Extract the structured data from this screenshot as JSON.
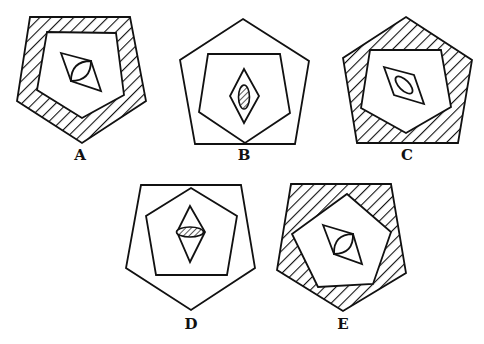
{
  "figures": [
    {
      "id": "A",
      "label": "A",
      "label_pos": [
        80,
        160
      ],
      "outer": {
        "points": "30,17 130,17 146,101 82,143 17,101",
        "fill": "hatched"
      },
      "inner": {
        "points": "47,32 116,33 124,95 82,118 37,90",
        "fill": "white"
      },
      "diamond": {
        "points": "61,53 91,61 101,91 71,81"
      },
      "shape": {
        "type": "lens",
        "from": [
          71,
          81
        ],
        "to": [
          91,
          61
        ],
        "bulge": 7,
        "fill": "none"
      }
    },
    {
      "id": "B",
      "label": "B",
      "label_pos": [
        244,
        160
      ],
      "outer": {
        "points": "243,19 309,61 295,144 195,144 180,60",
        "fill": "none"
      },
      "inner": {
        "points": "208,54 280,54 290,113 245,143 199,112",
        "fill": "none"
      },
      "diamond": {
        "points": "244,69 259,96 244,123 230,96"
      },
      "shape": {
        "type": "ellipse",
        "cx": 244,
        "cy": 97,
        "rx": 5.5,
        "ry": 12,
        "rotate": 0,
        "fill": "hatched"
      }
    },
    {
      "id": "C",
      "label": "C",
      "label_pos": [
        407,
        160
      ],
      "outer": {
        "points": "406,17 472,60 458,143 357,143 343,58",
        "fill": "hatched"
      },
      "inner": {
        "points": "370,50 441,50 451,107 406,133 361,108",
        "fill": "white"
      },
      "diamond": {
        "points": "384,67 414,75 424,104 394,95"
      },
      "shape": {
        "type": "ellipse",
        "cx": 404,
        "cy": 85,
        "rx": 11,
        "ry": 5,
        "rotate": 45,
        "fill": "none"
      }
    },
    {
      "id": "D",
      "label": "D",
      "label_pos": [
        191,
        329
      ],
      "outer": {
        "points": "141,185 241,185 255,268 191,310 126,268",
        "fill": "none"
      },
      "inner": {
        "points": "191,188 237,216 227,275 156,275 146,216",
        "fill": "none"
      },
      "diamond": {
        "points": "190,206 205,232 190,262 177,232"
      },
      "shape": {
        "type": "ellipse",
        "cx": 190,
        "cy": 232,
        "rx": 13.5,
        "ry": 5,
        "rotate": 0,
        "fill": "hatched"
      }
    },
    {
      "id": "E",
      "label": "E",
      "label_pos": [
        343,
        329
      ],
      "outer": {
        "points": "291,184 391,184 406,273 343,311 277,270",
        "fill": "hatched"
      },
      "inner": {
        "points": "347,194 391,232 373,284 318,287 292,234",
        "fill": "white"
      },
      "diamond": {
        "points": "323,225 353,234 362,264 334,254"
      },
      "shape": {
        "type": "lens",
        "from": [
          334,
          254
        ],
        "to": [
          353,
          234
        ],
        "bulge": 7,
        "fill": "none"
      }
    }
  ],
  "colors": {
    "stroke": "#111111",
    "background": "#ffffff"
  }
}
